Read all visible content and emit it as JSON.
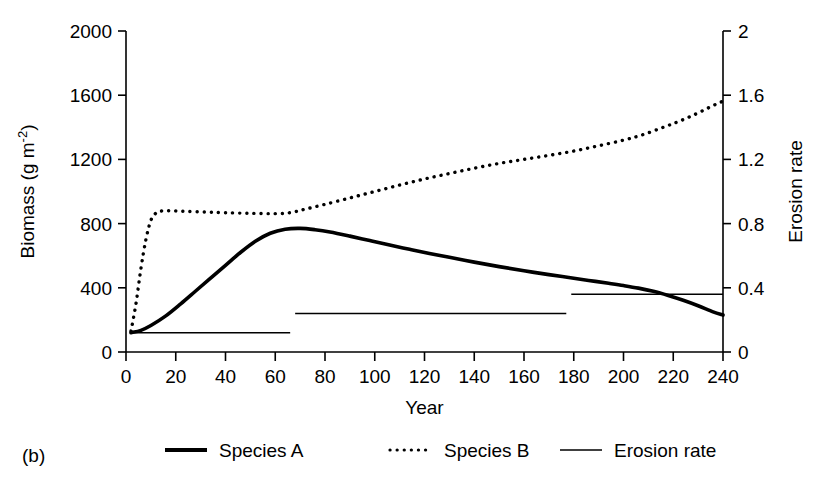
{
  "panel": {
    "label": "(b)"
  },
  "chart_data": {
    "type": "line",
    "title": "",
    "xlabel": "Year",
    "ylabel_left": "Biomass (g m",
    "ylabel_left_sup": "-2",
    "ylabel_left_tail": ")",
    "ylabel_right": "Erosion rate",
    "xlim": [
      0,
      240
    ],
    "ylim_left": [
      0,
      2000
    ],
    "ylim_right": [
      0,
      2
    ],
    "xticks": [
      0,
      20,
      40,
      60,
      80,
      100,
      120,
      140,
      160,
      180,
      200,
      220,
      240
    ],
    "xtick_labels": [
      "0",
      "20",
      "40",
      "60",
      "80",
      "100",
      "120",
      "140",
      "160",
      "180",
      "200",
      "220",
      "240"
    ],
    "yticks_left": [
      0,
      400,
      800,
      1200,
      1600,
      2000
    ],
    "ytick_labels_left": [
      "0",
      "400",
      "800",
      "1200",
      "1600",
      "2000"
    ],
    "yticks_right": [
      0,
      0.4,
      0.8,
      1.2,
      1.6,
      2
    ],
    "ytick_labels_right": [
      "0",
      "0.4",
      "0.8",
      "1.2",
      "1.6",
      "2"
    ],
    "grid": false,
    "legend_position": "below",
    "series": [
      {
        "name": "Species A",
        "axis": "left",
        "style": "solid-thick",
        "color": "#000000",
        "x": [
          2,
          6,
          10,
          16,
          22,
          28,
          34,
          40,
          46,
          52,
          58,
          64,
          70,
          76,
          82,
          90,
          98,
          106,
          114,
          122,
          130,
          140,
          150,
          160,
          170,
          178,
          186,
          194,
          200,
          206,
          212,
          218,
          224,
          230,
          236,
          240
        ],
        "y": [
          120,
          135,
          165,
          225,
          300,
          380,
          460,
          540,
          620,
          690,
          740,
          765,
          770,
          762,
          748,
          722,
          694,
          666,
          640,
          614,
          590,
          560,
          532,
          506,
          482,
          464,
          446,
          428,
          414,
          398,
          378,
          352,
          322,
          288,
          250,
          230
        ]
      },
      {
        "name": "Species B",
        "axis": "left",
        "style": "dotted",
        "color": "#000000",
        "x": [
          2,
          4,
          6,
          8,
          10,
          12,
          14,
          18,
          24,
          32,
          40,
          50,
          60,
          66,
          72,
          80,
          90,
          100,
          110,
          120,
          130,
          140,
          150,
          160,
          170,
          180,
          190,
          200,
          208,
          216,
          222,
          228,
          234,
          238,
          240
        ],
        "y": [
          130,
          300,
          520,
          700,
          820,
          865,
          878,
          880,
          876,
          872,
          868,
          864,
          862,
          868,
          890,
          920,
          960,
          1000,
          1040,
          1078,
          1112,
          1145,
          1175,
          1200,
          1225,
          1252,
          1285,
          1320,
          1355,
          1400,
          1435,
          1475,
          1520,
          1550,
          1562
        ]
      },
      {
        "name": "Erosion rate",
        "axis": "right",
        "style": "solid-thin-step",
        "color": "#000000",
        "steps": [
          {
            "x_start": 2,
            "x_end": 66,
            "value": 0.12
          },
          {
            "x_start": 68,
            "x_end": 177,
            "value": 0.24
          },
          {
            "x_start": 179,
            "x_end": 240,
            "value": 0.36
          }
        ]
      }
    ],
    "legend": [
      {
        "label": "Species A",
        "style": "solid-thick"
      },
      {
        "label": "Species B",
        "style": "dotted"
      },
      {
        "label": "Erosion rate",
        "style": "solid-thin"
      }
    ]
  }
}
